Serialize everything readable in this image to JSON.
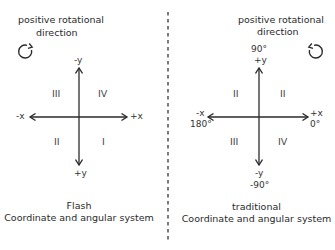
{
  "left_panel": {
    "heading_line1": "positive rotational",
    "heading_line2": "direction",
    "rotation_icon": "clockwise-arrow",
    "axes": {
      "top": "-y",
      "bottom": "+y",
      "left": "-x",
      "right": "+x"
    },
    "quadrants": {
      "upper_left": "III",
      "upper_right": "IV",
      "lower_left": "II",
      "lower_right": "I"
    },
    "caption_line1": "Flash",
    "caption_line2": "Coordinate and angular system"
  },
  "right_panel": {
    "heading_line1": "positive rotational",
    "heading_line2": "direction",
    "rotation_icon": "counterclockwise-arrow",
    "axes": {
      "top_angle": "90°",
      "top": "+y",
      "bottom": "-y",
      "bottom_angle": "-90°",
      "left": "-x",
      "left_angle": "180°",
      "right": "+x",
      "right_angle": "0°"
    },
    "quadrants": {
      "upper_left": "II",
      "upper_right": "II",
      "lower_left": "III",
      "lower_right": "IV"
    },
    "caption_line1": "traditional",
    "caption_line2": "Coordinate and angular system"
  },
  "colors": {
    "line": "#2a2a2a",
    "background": "#ffffff"
  }
}
